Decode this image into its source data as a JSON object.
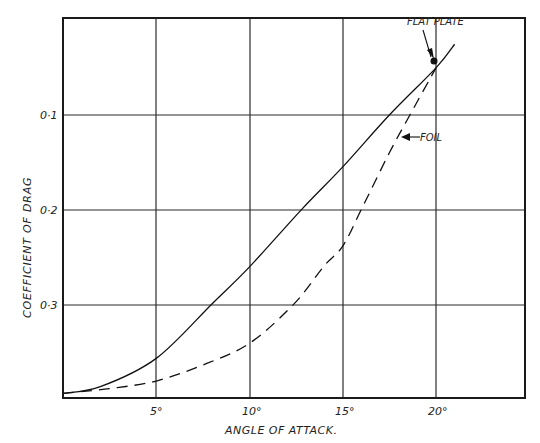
{
  "chart_data": {
    "type": "line",
    "title": "",
    "xlabel": "ANGLE OF ATTACK.",
    "ylabel": "COEFFICIENT OF DRAG",
    "xlim": [
      0,
      25
    ],
    "ylim": [
      0,
      0.4
    ],
    "grid": true,
    "x_ticks": [
      5,
      10,
      15,
      20
    ],
    "x_tick_labels": [
      "5°",
      "10°",
      "15°",
      "20°"
    ],
    "y_ticks": [
      0.1,
      0.2,
      0.3
    ],
    "y_tick_labels": [
      "0·1",
      "0·2",
      "0·3"
    ],
    "legend": "inline annotations",
    "series": [
      {
        "name": "FLAT PLATE",
        "style": "solid",
        "x": [
          0,
          2,
          5,
          8,
          10,
          12.8,
          15,
          17.5,
          20,
          21
        ],
        "y": [
          0.005,
          0.012,
          0.042,
          0.1,
          0.139,
          0.2,
          0.245,
          0.3,
          0.35,
          0.375
        ]
      },
      {
        "name": "FOIL",
        "style": "dashed",
        "x": [
          0,
          2.5,
          5,
          7.5,
          10,
          12.4,
          14,
          15,
          16,
          17.5,
          18.6,
          20
        ],
        "y": [
          0.005,
          0.01,
          0.018,
          0.035,
          0.058,
          0.1,
          0.14,
          0.161,
          0.2,
          0.26,
          0.3,
          0.35
        ]
      }
    ],
    "annotations": [
      {
        "text": "FLAT PLATE",
        "points_to": [
          20,
          0.35
        ]
      },
      {
        "text": "FOIL",
        "points_to": [
          18,
          0.275
        ]
      }
    ]
  },
  "labels": {
    "xlabel": "ANGLE OF ATTACK.",
    "ylabel": "COEFFICIENT OF DRAG",
    "flat_plate": "FLAT PLATE",
    "foil": "FOIL",
    "xticks": [
      "5°",
      "10°",
      "15°",
      "20°"
    ],
    "yticks": [
      "0·1",
      "0·2",
      "0·3"
    ]
  }
}
